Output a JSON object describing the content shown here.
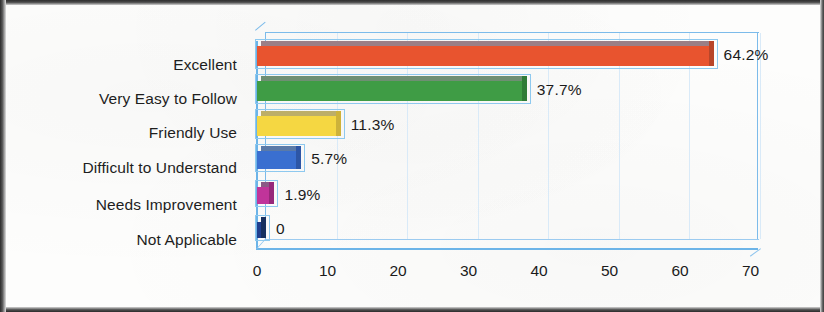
{
  "chart_data": {
    "type": "bar",
    "orientation": "horizontal",
    "title": "",
    "xlabel": "",
    "ylabel": "",
    "xlim": [
      0,
      70
    ],
    "xticks": [
      "0",
      "10",
      "20",
      "30",
      "40",
      "50",
      "60",
      "70"
    ],
    "grid": true,
    "legend": "none",
    "style": "3d",
    "categories": [
      "Excellent",
      "Very Easy to Follow",
      "Friendly Use",
      "Difficult to Understand",
      "Needs Improvement",
      "Not Applicable"
    ],
    "values": [
      64.2,
      37.7,
      11.3,
      5.7,
      1.9,
      0
    ],
    "data_labels": [
      "64.2%",
      "37.7%",
      "11.3%",
      "5.7%",
      "1.9%",
      "0"
    ],
    "colors": [
      "#e8542f",
      "#3f9c45",
      "#f5d742",
      "#3a6fd0",
      "#c0349a",
      "#1f3f8f"
    ],
    "top_face_colors": [
      "#9b7f86",
      "#6f8f73",
      "#bdae68",
      "#5a7aa8",
      "#8a5a86",
      "#33406a"
    ],
    "cap_colors": [
      "#b8462a",
      "#2f7c37",
      "#cdb23a",
      "#2d56a6",
      "#96287a",
      "#17305f"
    ],
    "plot_frame_color": "#6cb4e8",
    "gridline_color": "#d9eaf8"
  }
}
